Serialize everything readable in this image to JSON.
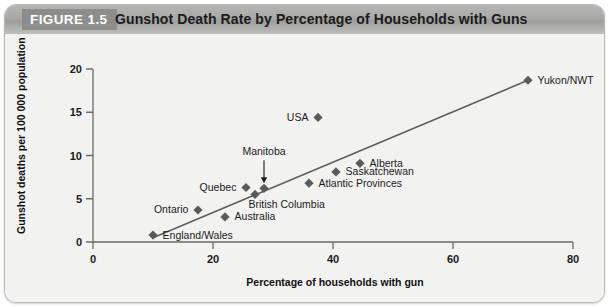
{
  "figure": {
    "tag": "FIGURE 1.5",
    "title": "Gunshot Death Rate by Percentage of Households with Guns"
  },
  "chart_data": {
    "type": "scatter",
    "title": "Gunshot Death Rate by Percentage of Households with Guns",
    "xlabel": "Percentage of households with gun",
    "ylabel": "Gunshot deaths per 100 000 population",
    "xlim": [
      0,
      80
    ],
    "ylim": [
      0,
      20
    ],
    "xticks": [
      "0",
      "20",
      "40",
      "60",
      "80"
    ],
    "xtick_values": [
      0,
      20,
      40,
      60,
      80
    ],
    "yticks": [
      "0",
      "5",
      "10",
      "15",
      "20"
    ],
    "ytick_values": [
      0,
      5,
      10,
      15,
      20
    ],
    "grid": false,
    "legend": "none",
    "marker_shape": "diamond",
    "marker_color": "#5a5a5a",
    "trendline": {
      "present": true,
      "color": "#5e5e5e",
      "x_start": 10.0,
      "y_start": 0.5,
      "x_end": 72.5,
      "y_end": 18.7
    },
    "points": [
      {
        "label": "England/Wales",
        "x": 10.0,
        "y": 0.8,
        "label_pos": "right"
      },
      {
        "label": "Ontario",
        "x": 17.5,
        "y": 3.7,
        "label_pos": "left"
      },
      {
        "label": "Australia",
        "x": 22.0,
        "y": 2.9,
        "label_pos": "right"
      },
      {
        "label": "Quebec",
        "x": 25.5,
        "y": 6.3,
        "label_pos": "left"
      },
      {
        "label": "British Columbia",
        "x": 27.0,
        "y": 5.5,
        "label_pos": "below-right"
      },
      {
        "label": "Manitoba",
        "x": 28.5,
        "y": 6.2,
        "label_pos": "callout-above"
      },
      {
        "label": "Atlantic Provinces",
        "x": 36.0,
        "y": 6.8,
        "label_pos": "right"
      },
      {
        "label": "USA",
        "x": 37.5,
        "y": 14.4,
        "label_pos": "left"
      },
      {
        "label": "Saskatchewan",
        "x": 40.5,
        "y": 8.1,
        "label_pos": "right"
      },
      {
        "label": "Alberta",
        "x": 44.5,
        "y": 9.1,
        "label_pos": "right"
      },
      {
        "label": "Yukon/NWT",
        "x": 72.5,
        "y": 18.7,
        "label_pos": "right"
      }
    ],
    "annotations": [
      {
        "text": "Manitoba",
        "type": "callout-arrow",
        "points_to": "Manitoba"
      }
    ]
  }
}
